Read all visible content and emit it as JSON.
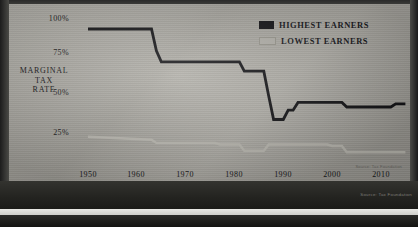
{
  "chart_data": {
    "type": "line",
    "title": "",
    "xlabel": "",
    "ylabel": "MARGINAL TAX RATE",
    "ylabel_lines": [
      "MARGINAL",
      "TAX",
      "RATE"
    ],
    "xlim": [
      1946,
      2016
    ],
    "ylim": [
      0,
      105
    ],
    "grid": false,
    "legend_position": "top-right",
    "y_ticks": [
      "25%",
      "50%",
      "75%",
      "100%"
    ],
    "y_tick_values": [
      25,
      50,
      75,
      100
    ],
    "x_ticks": [
      "1950",
      "1960",
      "1970",
      "1980",
      "1990",
      "2000",
      "2010"
    ],
    "x_tick_values": [
      1950,
      1960,
      1970,
      1980,
      1990,
      2000,
      2010
    ],
    "series": [
      {
        "name": "HIGHEST EARNERS",
        "color": "#121215",
        "points": [
          [
            1950,
            91
          ],
          [
            1963,
            91
          ],
          [
            1964,
            77
          ],
          [
            1965,
            70
          ],
          [
            1981,
            70
          ],
          [
            1982,
            64
          ],
          [
            1986,
            64
          ],
          [
            1987,
            48
          ],
          [
            1988,
            33
          ],
          [
            1990,
            33
          ],
          [
            1991,
            39
          ],
          [
            1992,
            39
          ],
          [
            1993,
            44
          ],
          [
            2002,
            44
          ],
          [
            2003,
            41
          ],
          [
            2012,
            41
          ],
          [
            2013,
            43
          ],
          [
            2015,
            43
          ]
        ]
      },
      {
        "name": "LOWEST EARNERS",
        "color": "#c2c0b8",
        "points": [
          [
            1950,
            22
          ],
          [
            1963,
            20
          ],
          [
            1964,
            18
          ],
          [
            1976,
            18
          ],
          [
            1977,
            17
          ],
          [
            1981,
            17
          ],
          [
            1982,
            13
          ],
          [
            1986,
            13
          ],
          [
            1987,
            17
          ],
          [
            1999,
            17
          ],
          [
            2000,
            16
          ],
          [
            2002,
            16
          ],
          [
            2003,
            12
          ],
          [
            2015,
            12
          ]
        ]
      }
    ],
    "legend": [
      {
        "label": "HIGHEST EARNERS",
        "swatch": "dark"
      },
      {
        "label": "LOWEST EARNERS",
        "swatch": "light"
      }
    ],
    "source_note": "Source: Tax Foundation"
  }
}
